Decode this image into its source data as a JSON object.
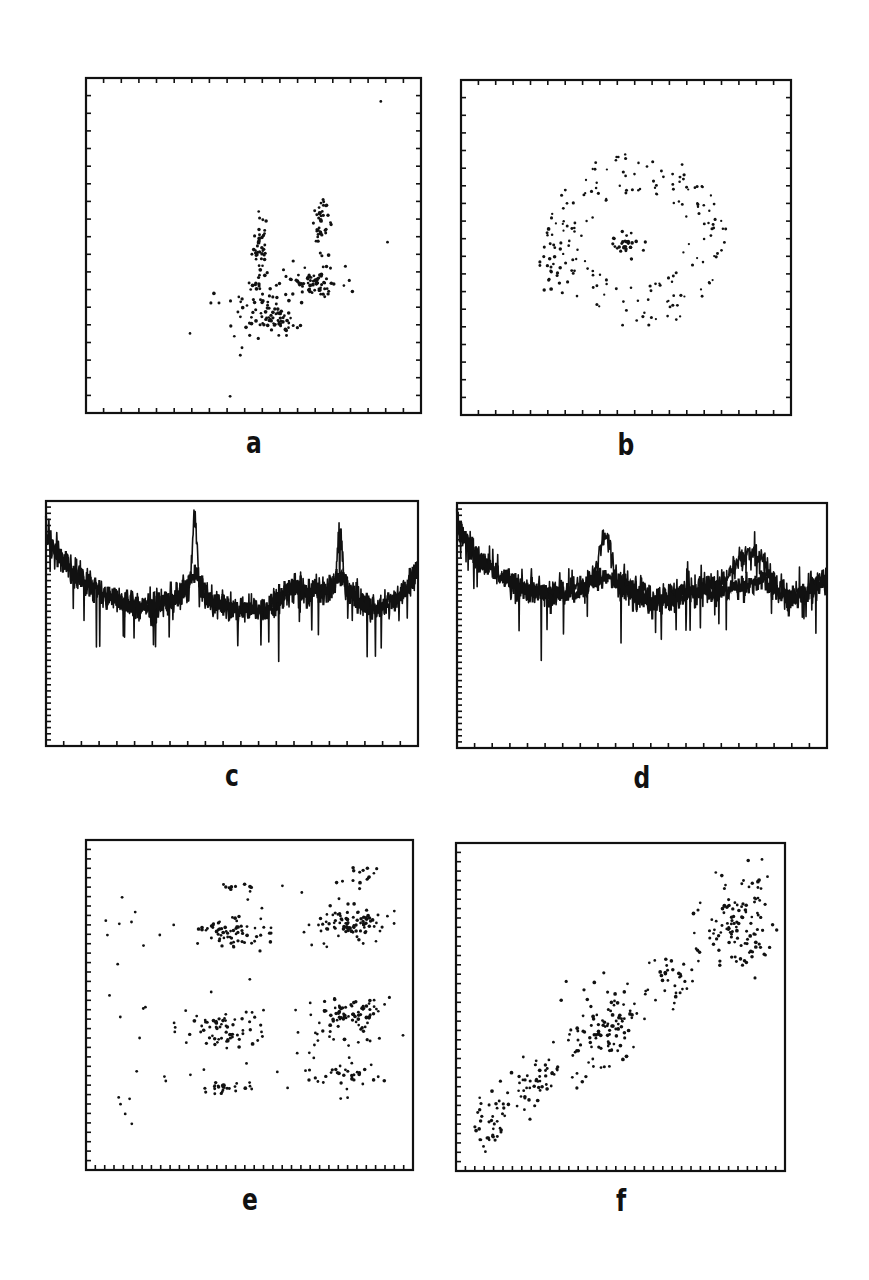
{
  "figure": {
    "panels": [
      {
        "id": "a",
        "label": "a",
        "type": "scatter",
        "frame": [
          86,
          78,
          335,
          335
        ],
        "ticks_x": 19,
        "ticks_y": 19
      },
      {
        "id": "b",
        "label": "b",
        "type": "scatter",
        "frame": [
          461,
          80,
          330,
          335
        ],
        "ticks_x": 19,
        "ticks_y": 19
      },
      {
        "id": "c",
        "label": "c",
        "type": "line",
        "frame": [
          46,
          501,
          372,
          245
        ],
        "ticks_x": 21,
        "ticks_y": 40
      },
      {
        "id": "d",
        "label": "d",
        "type": "line",
        "frame": [
          457,
          503,
          370,
          245
        ],
        "ticks_x": 21,
        "ticks_y": 40
      },
      {
        "id": "e",
        "label": "e",
        "type": "scatter",
        "frame": [
          86,
          840,
          327,
          330
        ],
        "ticks_x": 35,
        "ticks_y": 35
      },
      {
        "id": "f",
        "label": "f",
        "type": "scatter",
        "frame": [
          456,
          843,
          329,
          328
        ],
        "ticks_x": 35,
        "ticks_y": 35
      }
    ],
    "label_color": "#111111",
    "ink_color": "#111111"
  },
  "chart_data": [
    {
      "panel": "a",
      "type": "scatter",
      "title": "",
      "xlabel": "",
      "ylabel": "",
      "xlim": [
        0,
        1
      ],
      "ylim": [
        0,
        1
      ],
      "grid": false,
      "description": "Sparse point cloud in lower-right quadrant with two vertical streaks and a curved band",
      "clusters": [
        {
          "cx": 0.52,
          "cy": 0.5,
          "sx": 0.012,
          "sy": 0.05,
          "n": 40
        },
        {
          "cx": 0.7,
          "cy": 0.56,
          "sx": 0.012,
          "sy": 0.04,
          "n": 40
        },
        {
          "cx": 0.68,
          "cy": 0.39,
          "sx": 0.04,
          "sy": 0.025,
          "n": 70
        },
        {
          "cx": 0.57,
          "cy": 0.28,
          "sx": 0.035,
          "sy": 0.02,
          "n": 55
        },
        {
          "cx": 0.48,
          "cy": 0.33,
          "sx": 0.05,
          "sy": 0.06,
          "n": 50
        }
      ],
      "outliers": [
        [
          0.43,
          0.05
        ],
        [
          0.9,
          0.51
        ],
        [
          0.88,
          0.93
        ]
      ]
    },
    {
      "panel": "b",
      "type": "scatter",
      "title": "",
      "xlabel": "",
      "ylabel": "",
      "xlim": [
        0,
        1
      ],
      "ylim": [
        0,
        1
      ],
      "grid": false,
      "description": "Diffuse roughly circular ring of points with denser center cluster",
      "ring": {
        "cx": 0.53,
        "cy": 0.52,
        "rx": 0.27,
        "ry": 0.25,
        "n": 170
      },
      "clusters": [
        {
          "cx": 0.5,
          "cy": 0.5,
          "sx": 0.03,
          "sy": 0.025,
          "n": 30
        },
        {
          "cx": 0.27,
          "cy": 0.45,
          "sx": 0.02,
          "sy": 0.05,
          "n": 25
        }
      ]
    },
    {
      "panel": "c",
      "type": "line",
      "title": "",
      "xlabel": "",
      "ylabel": "",
      "xlim": [
        0,
        1
      ],
      "ylim": [
        0,
        1
      ],
      "grid": false,
      "description": "Noisy spectrum: high at left edge decaying, two sharp peaks, broad humps",
      "baseline": [
        [
          0.0,
          0.86
        ],
        [
          0.05,
          0.74
        ],
        [
          0.15,
          0.62
        ],
        [
          0.25,
          0.57
        ],
        [
          0.38,
          0.6
        ],
        [
          0.46,
          0.58
        ],
        [
          0.53,
          0.55
        ],
        [
          0.6,
          0.56
        ],
        [
          0.66,
          0.64
        ],
        [
          0.77,
          0.62
        ],
        [
          0.82,
          0.6
        ],
        [
          0.88,
          0.56
        ],
        [
          0.95,
          0.6
        ],
        [
          1.0,
          0.72
        ]
      ],
      "peaks": [
        {
          "x": 0.4,
          "height": 0.9,
          "width": 0.006
        },
        {
          "x": 0.79,
          "height": 0.83,
          "width": 0.006
        }
      ],
      "noise_amp": 0.06,
      "dips_depth": 0.14
    },
    {
      "panel": "d",
      "type": "line",
      "title": "",
      "xlabel": "",
      "ylabel": "",
      "xlim": [
        0,
        1
      ],
      "ylim": [
        0,
        1
      ],
      "grid": false,
      "description": "Noisy spectrum similar to c but with broad rounded peaks instead of sharp ones",
      "baseline": [
        [
          0.0,
          0.92
        ],
        [
          0.05,
          0.78
        ],
        [
          0.15,
          0.67
        ],
        [
          0.25,
          0.62
        ],
        [
          0.35,
          0.63
        ],
        [
          0.45,
          0.62
        ],
        [
          0.55,
          0.58
        ],
        [
          0.65,
          0.62
        ],
        [
          0.72,
          0.6
        ],
        [
          0.82,
          0.65
        ],
        [
          0.9,
          0.56
        ],
        [
          1.0,
          0.68
        ]
      ],
      "peaks": [
        {
          "x": 0.4,
          "height": 0.82,
          "width": 0.015
        },
        {
          "x": 0.79,
          "height": 0.74,
          "width": 0.04
        }
      ],
      "noise_amp": 0.06,
      "dips_depth": 0.13
    },
    {
      "panel": "e",
      "type": "scatter",
      "title": "",
      "xlabel": "",
      "ylabel": "",
      "xlim": [
        0,
        1
      ],
      "ylim": [
        0,
        1
      ],
      "grid": false,
      "description": "Points arranged in horizontal bands with dense clusters at two x-positions",
      "clusters": [
        {
          "cx": 0.43,
          "cy": 0.72,
          "sx": 0.05,
          "sy": 0.025,
          "n": 55
        },
        {
          "cx": 0.81,
          "cy": 0.75,
          "sx": 0.05,
          "sy": 0.025,
          "n": 75
        },
        {
          "cx": 0.43,
          "cy": 0.42,
          "sx": 0.045,
          "sy": 0.03,
          "n": 55
        },
        {
          "cx": 0.81,
          "cy": 0.46,
          "sx": 0.05,
          "sy": 0.03,
          "n": 70
        },
        {
          "cx": 0.42,
          "cy": 0.25,
          "sx": 0.03,
          "sy": 0.01,
          "n": 20
        },
        {
          "cx": 0.8,
          "cy": 0.28,
          "sx": 0.05,
          "sy": 0.015,
          "n": 25
        },
        {
          "cx": 0.45,
          "cy": 0.86,
          "sx": 0.02,
          "sy": 0.01,
          "n": 10
        },
        {
          "cx": 0.83,
          "cy": 0.89,
          "sx": 0.04,
          "sy": 0.02,
          "n": 15
        }
      ],
      "scatter_band": {
        "x_range": [
          0.06,
          0.95
        ],
        "rows": [
          0.72,
          0.44,
          0.28
        ],
        "n": 110
      },
      "outliers": [
        [
          0.12,
          0.17
        ],
        [
          0.14,
          0.14
        ],
        [
          0.1,
          0.22
        ]
      ]
    },
    {
      "panel": "f",
      "type": "scatter",
      "title": "",
      "xlabel": "",
      "ylabel": "",
      "xlim": [
        0,
        1
      ],
      "ylim": [
        0,
        1
      ],
      "grid": false,
      "description": "Strong positive linear correlation, clustered along diagonal from lower-left to upper-right",
      "trend": {
        "slope": 0.9,
        "intercept": 0.03
      },
      "clusters": [
        {
          "cx": 0.1,
          "cy": 0.15,
          "sx": 0.03,
          "sy": 0.05,
          "n": 35
        },
        {
          "cx": 0.25,
          "cy": 0.27,
          "sx": 0.06,
          "sy": 0.04,
          "n": 40
        },
        {
          "cx": 0.44,
          "cy": 0.44,
          "sx": 0.05,
          "sy": 0.06,
          "n": 85
        },
        {
          "cx": 0.66,
          "cy": 0.59,
          "sx": 0.03,
          "sy": 0.04,
          "n": 25
        },
        {
          "cx": 0.86,
          "cy": 0.75,
          "sx": 0.06,
          "sy": 0.07,
          "n": 110
        }
      ],
      "outliers": [
        [
          0.93,
          0.95
        ]
      ]
    }
  ]
}
